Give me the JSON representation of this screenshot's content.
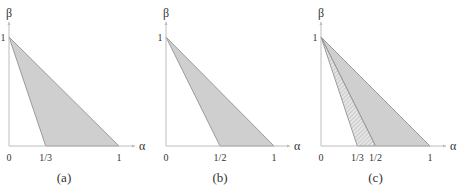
{
  "figure": {
    "axis_x_label": "α",
    "axis_y_label": "β",
    "colors": {
      "axis": "#bdbdbd",
      "region": "#cfcfcf",
      "edge": "#888888",
      "text": "#333333"
    },
    "panels": [
      {
        "id": "a",
        "caption": "(a)",
        "y_tick": "1",
        "x_ticks": [
          {
            "value": 0,
            "label": "0"
          },
          {
            "value": 0.3333,
            "label": "1/3"
          },
          {
            "value": 1,
            "label": "1"
          }
        ],
        "region": {
          "vertices": [
            [
              0,
              1
            ],
            [
              0.3333,
              0
            ],
            [
              1,
              0
            ]
          ],
          "style": "shaded"
        }
      },
      {
        "id": "b",
        "caption": "(b)",
        "y_tick": "1",
        "x_ticks": [
          {
            "value": 0,
            "label": "0"
          },
          {
            "value": 0.5,
            "label": "1/2"
          },
          {
            "value": 1,
            "label": "1"
          }
        ],
        "region": {
          "vertices": [
            [
              0,
              1
            ],
            [
              0.5,
              0
            ],
            [
              1,
              0
            ]
          ],
          "style": "shaded"
        }
      },
      {
        "id": "c",
        "caption": "(c)",
        "y_tick": "1",
        "x_ticks": [
          {
            "value": 0,
            "label": "0"
          },
          {
            "value": 0.3333,
            "label": "1/3"
          },
          {
            "value": 0.5,
            "label": "1/2"
          },
          {
            "value": 1,
            "label": "1"
          }
        ],
        "region": {
          "vertices": [
            [
              0,
              1
            ],
            [
              0.5,
              0
            ],
            [
              1,
              0
            ]
          ],
          "style": "shaded"
        },
        "hatched_region": {
          "vertices": [
            [
              0,
              1
            ],
            [
              0.3333,
              0
            ],
            [
              0.5,
              0
            ]
          ],
          "style": "hatched"
        }
      }
    ]
  }
}
